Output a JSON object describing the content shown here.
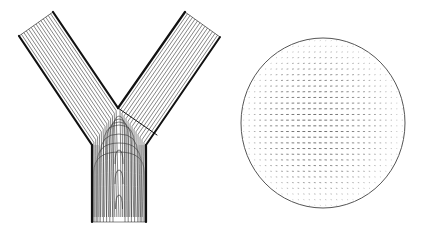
{
  "figure": {
    "description": "Y-shaped bifurcation flow streamlines and circular cross-section velocity vector field",
    "colors": {
      "background": "#ffffff",
      "wall": "#111111",
      "streamline": "#333333",
      "vector": "#222222",
      "circle_outline": "#555555"
    },
    "panels": [
      {
        "id": "bifurcation",
        "label": "Bifurcation streamlines",
        "geometry": {
          "left_branch": {
            "outer_top": [
              19,
              36
            ],
            "inner_top": [
              53,
              12
            ],
            "outer_bottom": [
              92,
              145
            ]
          },
          "right_branch": {
            "inner_top": [
              185,
              12
            ],
            "outer_top": [
              220,
              37
            ],
            "outer_bottom": [
              146,
              145
            ]
          },
          "apex": [
            118,
            108
          ],
          "junction_line_end": [
            157,
            135
          ],
          "trunk": {
            "left_x": 92,
            "right_x": 146,
            "top_y": 145,
            "bottom_y": 222
          }
        }
      },
      {
        "id": "cross-section",
        "label": "Cross-section velocity vectors",
        "geometry": {
          "cx": 323,
          "cy": 123,
          "rx": 82,
          "ry": 85
        }
      }
    ]
  }
}
